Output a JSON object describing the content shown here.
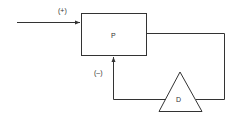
{
  "diagram": {
    "type": "feedback-loop",
    "input_sign": "(+)",
    "feedback_sign": "(–)",
    "process_block": {
      "label": "P",
      "shape": "rectangle"
    },
    "feedback_block": {
      "label": "D",
      "shape": "triangle"
    },
    "colors": {
      "stroke": "#333333",
      "background": "#ffffff"
    }
  }
}
